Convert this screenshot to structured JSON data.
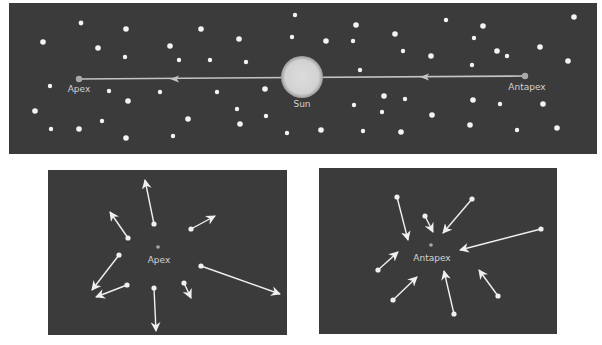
{
  "colors": {
    "background": "#ffffff",
    "panel": "#3b3b3b",
    "star": "#f4f4f4",
    "sun": "#d6d6d6",
    "motion_line": "#c4c4c4",
    "marker": "#a9a9a9",
    "label": "#d2d2d2",
    "arrow": "#f0f0f0"
  },
  "top_panel": {
    "box": {
      "x": 9,
      "y": 3,
      "w": 588,
      "h": 151
    },
    "sun": {
      "label": "Sun",
      "cx": 302,
      "cy": 77,
      "r": 21
    },
    "apex": {
      "label": "Apex",
      "cx": 79,
      "cy": 79
    },
    "antapex": {
      "label": "Antapex",
      "cx": 525,
      "cy": 76
    },
    "arrowheads": [
      {
        "x": 175,
        "y": 79
      },
      {
        "x": 425,
        "y": 77
      }
    ],
    "stars": [
      [
        81,
        23,
        2.4
      ],
      [
        126,
        29,
        2.8
      ],
      [
        43,
        42,
        2.8
      ],
      [
        98,
        48,
        2.8
      ],
      [
        125,
        57,
        2.2
      ],
      [
        50,
        86,
        2.2
      ],
      [
        109,
        91,
        2.2
      ],
      [
        128,
        101,
        2.8
      ],
      [
        35,
        111,
        2.8
      ],
      [
        102,
        121,
        2.2
      ],
      [
        51,
        129,
        2.2
      ],
      [
        79,
        129,
        2.8
      ],
      [
        126,
        138,
        2.8
      ],
      [
        201,
        29,
        2.8
      ],
      [
        239,
        39,
        2.8
      ],
      [
        170,
        46,
        2.8
      ],
      [
        179,
        60,
        2.2
      ],
      [
        210,
        60,
        2.2
      ],
      [
        246,
        62,
        2.2
      ],
      [
        295,
        15,
        2.2
      ],
      [
        292,
        37,
        2.2
      ],
      [
        160,
        92,
        2.2
      ],
      [
        217,
        92,
        2.2
      ],
      [
        265,
        89,
        2.8
      ],
      [
        237,
        109,
        2.2
      ],
      [
        266,
        116,
        2.2
      ],
      [
        188,
        119,
        2.8
      ],
      [
        240,
        124,
        2.8
      ],
      [
        173,
        136,
        2.2
      ],
      [
        287,
        133,
        2.2
      ],
      [
        356,
        25,
        2.8
      ],
      [
        326,
        41,
        2.8
      ],
      [
        353,
        41,
        2.2
      ],
      [
        395,
        34,
        2.8
      ],
      [
        403,
        51,
        2.2
      ],
      [
        431,
        56,
        2.8
      ],
      [
        360,
        70,
        2.2
      ],
      [
        384,
        96,
        2.8
      ],
      [
        405,
        99,
        2.2
      ],
      [
        354,
        105,
        2.2
      ],
      [
        382,
        112,
        2.2
      ],
      [
        432,
        115,
        2.8
      ],
      [
        321,
        130,
        2.8
      ],
      [
        363,
        131,
        2.2
      ],
      [
        401,
        132,
        2.8
      ],
      [
        446,
        20,
        2.2
      ],
      [
        574,
        17,
        2.8
      ],
      [
        483,
        26,
        2.8
      ],
      [
        474,
        38,
        2.2
      ],
      [
        540,
        47,
        2.8
      ],
      [
        497,
        51,
        2.8
      ],
      [
        507,
        56,
        2.2
      ],
      [
        568,
        61,
        2.8
      ],
      [
        472,
        65,
        2.2
      ],
      [
        473,
        100,
        2.8
      ],
      [
        500,
        104,
        2.2
      ],
      [
        543,
        104,
        2.8
      ],
      [
        470,
        125,
        2.8
      ],
      [
        517,
        130,
        2.2
      ],
      [
        557,
        128,
        2.8
      ]
    ]
  },
  "left_panel": {
    "box": {
      "x": 48,
      "y": 170,
      "w": 239,
      "h": 165
    },
    "center": {
      "label": "Apex",
      "cx": 158,
      "cy": 247
    },
    "vectors": [
      {
        "from": [
          154,
          224
        ],
        "to": [
          145,
          180
        ]
      },
      {
        "from": [
          128,
          238
        ],
        "to": [
          110,
          212
        ]
      },
      {
        "from": [
          191,
          229
        ],
        "to": [
          215,
          216
        ]
      },
      {
        "from": [
          119,
          255
        ],
        "to": [
          92,
          290
        ]
      },
      {
        "from": [
          201,
          266
        ],
        "to": [
          280,
          294
        ]
      },
      {
        "from": [
          127,
          285
        ],
        "to": [
          96,
          297
        ]
      },
      {
        "from": [
          154,
          288
        ],
        "to": [
          156,
          331
        ]
      },
      {
        "from": [
          184,
          283
        ],
        "to": [
          191,
          298
        ]
      }
    ]
  },
  "right_panel": {
    "box": {
      "x": 319,
      "y": 168,
      "w": 238,
      "h": 166
    },
    "center": {
      "label": "Antapex",
      "cx": 431,
      "cy": 245
    },
    "vectors": [
      {
        "from": [
          397,
          197
        ],
        "to": [
          408,
          240
        ]
      },
      {
        "from": [
          425,
          216
        ],
        "to": [
          433,
          232
        ]
      },
      {
        "from": [
          472,
          199
        ],
        "to": [
          443,
          233
        ]
      },
      {
        "from": [
          541,
          229
        ],
        "to": [
          460,
          250
        ]
      },
      {
        "from": [
          378,
          270
        ],
        "to": [
          398,
          252
        ]
      },
      {
        "from": [
          393,
          300
        ],
        "to": [
          417,
          277
        ]
      },
      {
        "from": [
          454,
          314
        ],
        "to": [
          444,
          271
        ]
      },
      {
        "from": [
          498,
          296
        ],
        "to": [
          479,
          270
        ]
      }
    ]
  }
}
